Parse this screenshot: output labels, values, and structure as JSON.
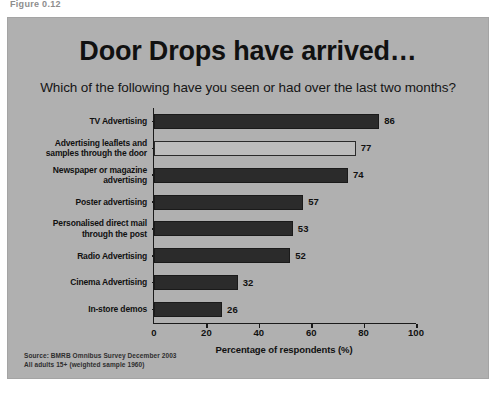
{
  "page": {
    "top_cropped_text": "Figure 0.12"
  },
  "slide": {
    "title": "Door Drops have arrived…",
    "subtitle": "Which of the following have you seen or had over the last two months?",
    "source_line_1": "Source:  BMRB Omnibus Survey December 2003",
    "source_line_2": "All adults 15+ (weighted sample 1960)",
    "background_color": "#b0b0b0",
    "bar_color": "#2b2b2b",
    "highlight_bar_color": "#bcbcbc"
  },
  "chart_data": {
    "type": "bar",
    "orientation": "horizontal",
    "title": "Door Drops have arrived…",
    "subtitle": "Which of the following have you seen or had over the last two months?",
    "xlabel": "Percentage of respondents (%)",
    "ylabel": "",
    "xlim": [
      0,
      100
    ],
    "xticks": [
      0,
      20,
      40,
      60,
      80,
      100
    ],
    "grid": false,
    "legend": false,
    "categories": [
      "TV Advertising",
      "Advertising leaflets and samples through the door",
      "Newspaper or magazine advertising",
      "Poster advertising",
      "Personalised direct mail through the post",
      "Radio Advertising",
      "Cinema Advertising",
      "In-store demos"
    ],
    "category_lines": [
      [
        "TV Advertising"
      ],
      [
        "Advertising leaflets and",
        "samples through the door"
      ],
      [
        "Newspaper or magazine",
        "advertising"
      ],
      [
        "Poster advertising"
      ],
      [
        "Personalised direct mail",
        "through the post"
      ],
      [
        "Radio Advertising"
      ],
      [
        "Cinema Advertising"
      ],
      [
        "In-store demos"
      ]
    ],
    "values": [
      86,
      77,
      74,
      57,
      53,
      52,
      32,
      26
    ],
    "value_labels": [
      "86",
      "77",
      "74",
      "57",
      "53",
      "52",
      "32",
      "26"
    ],
    "highlighted_index": 1
  }
}
